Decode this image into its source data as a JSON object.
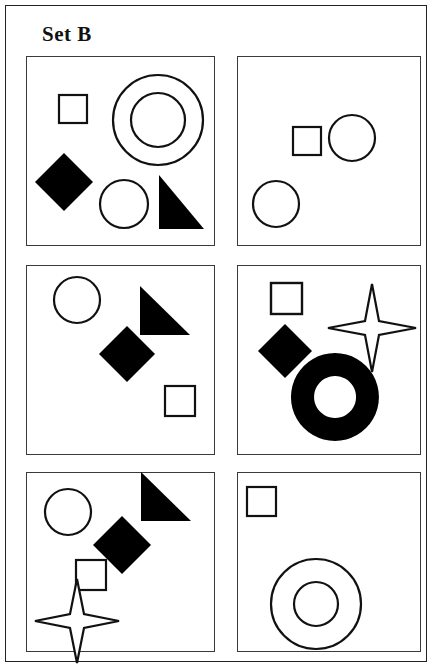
{
  "title": "Set B",
  "frame": {
    "stroke_color": "#222222",
    "background_color": "#ffffff"
  },
  "panels": [
    {
      "id": "panel-1",
      "position": "top-left",
      "shapes": [
        {
          "name": "square-outline",
          "fill": "none",
          "stroke": "#111111",
          "cx": 46,
          "cy": 52,
          "size": 28
        },
        {
          "name": "concentric-circles",
          "fill": "none",
          "stroke": "#111111",
          "cx": 131,
          "cy": 63,
          "outer_r": 45,
          "inner_r": 27
        },
        {
          "name": "diamond-filled",
          "fill": "#000000",
          "stroke": "none",
          "cx": 37,
          "cy": 125,
          "size": 58
        },
        {
          "name": "circle-outline",
          "fill": "none",
          "stroke": "#111111",
          "cx": 97,
          "cy": 147,
          "r": 24
        },
        {
          "name": "right-triangle-filled",
          "fill": "#000000",
          "stroke": "none",
          "x": 132,
          "y": 118,
          "w": 45,
          "h": 54
        }
      ]
    },
    {
      "id": "panel-2",
      "position": "top-right",
      "shapes": [
        {
          "name": "square-outline",
          "fill": "none",
          "stroke": "#111111",
          "cx": 69,
          "cy": 84,
          "size": 28
        },
        {
          "name": "circle-outline",
          "fill": "none",
          "stroke": "#111111",
          "cx": 114,
          "cy": 81,
          "r": 23
        },
        {
          "name": "circle-outline",
          "fill": "none",
          "stroke": "#111111",
          "cx": 38,
          "cy": 147,
          "r": 23
        }
      ]
    },
    {
      "id": "panel-3",
      "position": "middle-left",
      "shapes": [
        {
          "name": "circle-outline",
          "fill": "none",
          "stroke": "#111111",
          "cx": 50,
          "cy": 34,
          "r": 23
        },
        {
          "name": "right-triangle-filled",
          "fill": "#000000",
          "stroke": "none",
          "x": 113,
          "y": 20,
          "w": 50,
          "h": 49
        },
        {
          "name": "diamond-filled",
          "fill": "#000000",
          "stroke": "none",
          "cx": 100,
          "cy": 88,
          "size": 56
        },
        {
          "name": "square-outline",
          "fill": "none",
          "stroke": "#111111",
          "cx": 153,
          "cy": 135,
          "size": 30
        }
      ]
    },
    {
      "id": "panel-4",
      "position": "middle-right",
      "shapes": [
        {
          "name": "square-outline",
          "fill": "none",
          "stroke": "#111111",
          "cx": 49,
          "cy": 33,
          "size": 31
        },
        {
          "name": "four-point-star-outline",
          "fill": "none",
          "stroke": "#111111",
          "cx": 134,
          "cy": 62,
          "r_long": 44,
          "r_short": 10
        },
        {
          "name": "diamond-filled",
          "fill": "#000000",
          "stroke": "none",
          "cx": 47,
          "cy": 85,
          "size": 53
        },
        {
          "name": "donut-filled",
          "fill": "#000000",
          "stroke": "none",
          "cx": 97,
          "cy": 131,
          "outer_r": 44,
          "inner_r": 21
        }
      ]
    },
    {
      "id": "panel-5",
      "position": "bottom-left",
      "shapes": [
        {
          "name": "circle-outline",
          "fill": "none",
          "stroke": "#111111",
          "cx": 41,
          "cy": 39,
          "r": 23
        },
        {
          "name": "right-triangle-filled",
          "fill": "#000000",
          "stroke": "none",
          "x": 114,
          "y": 0,
          "w": 50,
          "h": 49
        },
        {
          "name": "diamond-filled",
          "fill": "#000000",
          "stroke": "none",
          "cx": 95,
          "cy": 72,
          "size": 58
        },
        {
          "name": "square-outline",
          "fill": "none",
          "stroke": "#111111",
          "cx": 64,
          "cy": 102,
          "size": 30
        },
        {
          "name": "four-point-star-outline",
          "fill": "none",
          "stroke": "#111111",
          "cx": 50,
          "cy": 148,
          "r_long": 42,
          "r_short": 10
        }
      ]
    },
    {
      "id": "panel-6",
      "position": "bottom-right",
      "shapes": [
        {
          "name": "square-outline",
          "fill": "none",
          "stroke": "#111111",
          "cx": 23,
          "cy": 28,
          "size": 29
        },
        {
          "name": "concentric-circles",
          "fill": "none",
          "stroke": "#111111",
          "cx": 78,
          "cy": 131,
          "outer_r": 45,
          "inner_r": 22
        }
      ]
    }
  ]
}
